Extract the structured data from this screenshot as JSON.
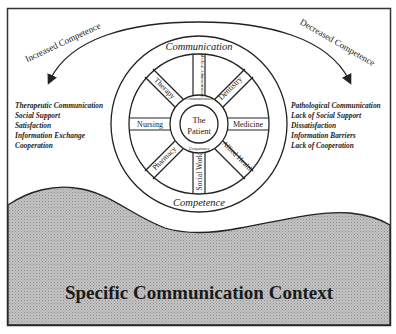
{
  "diagram": {
    "arrows": {
      "left_label": "Increased Competence",
      "right_label": "Decreased Competence"
    },
    "outer_ring": {
      "top_label": "Communication",
      "bottom_label": "Competence"
    },
    "hub": {
      "center_line1": "The",
      "center_line2": "Patient",
      "ring_top_label": "Communication",
      "ring_bottom_label": "Competence"
    },
    "spokes": [
      {
        "label": "Medical Administration",
        "angle": 0
      },
      {
        "label": "Dentistry",
        "angle": 45
      },
      {
        "label": "Medicine",
        "angle": 90
      },
      {
        "label": "Allied Health",
        "angle": 135
      },
      {
        "label": "Social Work",
        "angle": 180
      },
      {
        "label": "Pharmacy",
        "angle": 225
      },
      {
        "label": "Nursing",
        "angle": 270
      },
      {
        "label": "Therapy",
        "angle": 315
      }
    ],
    "positive_outcomes": [
      "Therapeutic Communication",
      "Social Support",
      "Satisfaction",
      "Information Exchange",
      "Cooperation"
    ],
    "negative_outcomes": [
      "Pathological Communication",
      "Lack of Social Support",
      "Dissatisfaction",
      "Information Barriers",
      "Lack of Cooperation"
    ],
    "context_label": "Specific Communication Context",
    "colors": {
      "line": "#222222",
      "ground_fill": "#b4b4b4",
      "background": "#ffffff"
    }
  }
}
